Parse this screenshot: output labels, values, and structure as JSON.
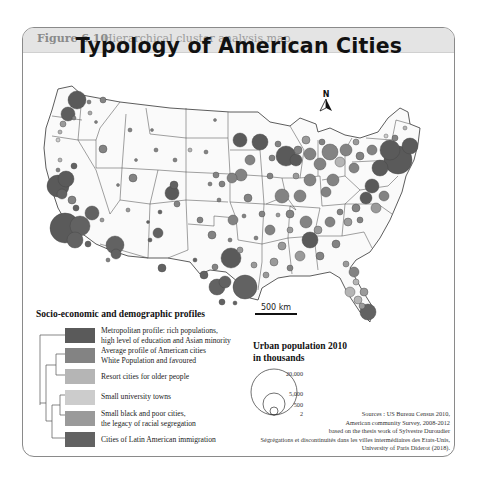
{
  "caption": {
    "figure_number": "Figure 6.10",
    "text": "Hierarchical cluster analysis map."
  },
  "map": {
    "title": "Typology of American Cities",
    "north_label": "N",
    "scale_label": "500 km"
  },
  "legend": {
    "title": "Socio-economic and demographic profiles",
    "items": [
      {
        "line1": "Metropolitan profile: rich populations,",
        "line2": "high level of education and Asian minority",
        "color": "#5a5a5a"
      },
      {
        "line1": "Average profile of American cities",
        "line2": "White Population and favoured",
        "color": "#838383"
      },
      {
        "line1": "Resort cities for older people",
        "line2": "",
        "color": "#b5b5b5"
      },
      {
        "line1": "Small university towns",
        "line2": "",
        "color": "#cccccc"
      },
      {
        "line1": "Small black and poor cities,",
        "line2": "the legacy of racial segregation",
        "color": "#9a9a9a"
      },
      {
        "line1": "Cities of Latin American immigration",
        "line2": "",
        "color": "#626262"
      }
    ]
  },
  "population_legend": {
    "title_line1": "Urban population 2010",
    "title_line2": "in thousands",
    "values": [
      "20,000",
      "5,000",
      "500",
      "2"
    ]
  },
  "sources": {
    "line1": "Sources : US Bureau Census 2010,",
    "line2": "American community Survey, 2008-2012",
    "line3": "based on the thesis work of Sylvestre Duroudier",
    "line4": "Ségrégations et discontinuités dans les villes intermédiaires des Etats-Unis,",
    "line5": "University of Paris Diderot (2018)."
  }
}
